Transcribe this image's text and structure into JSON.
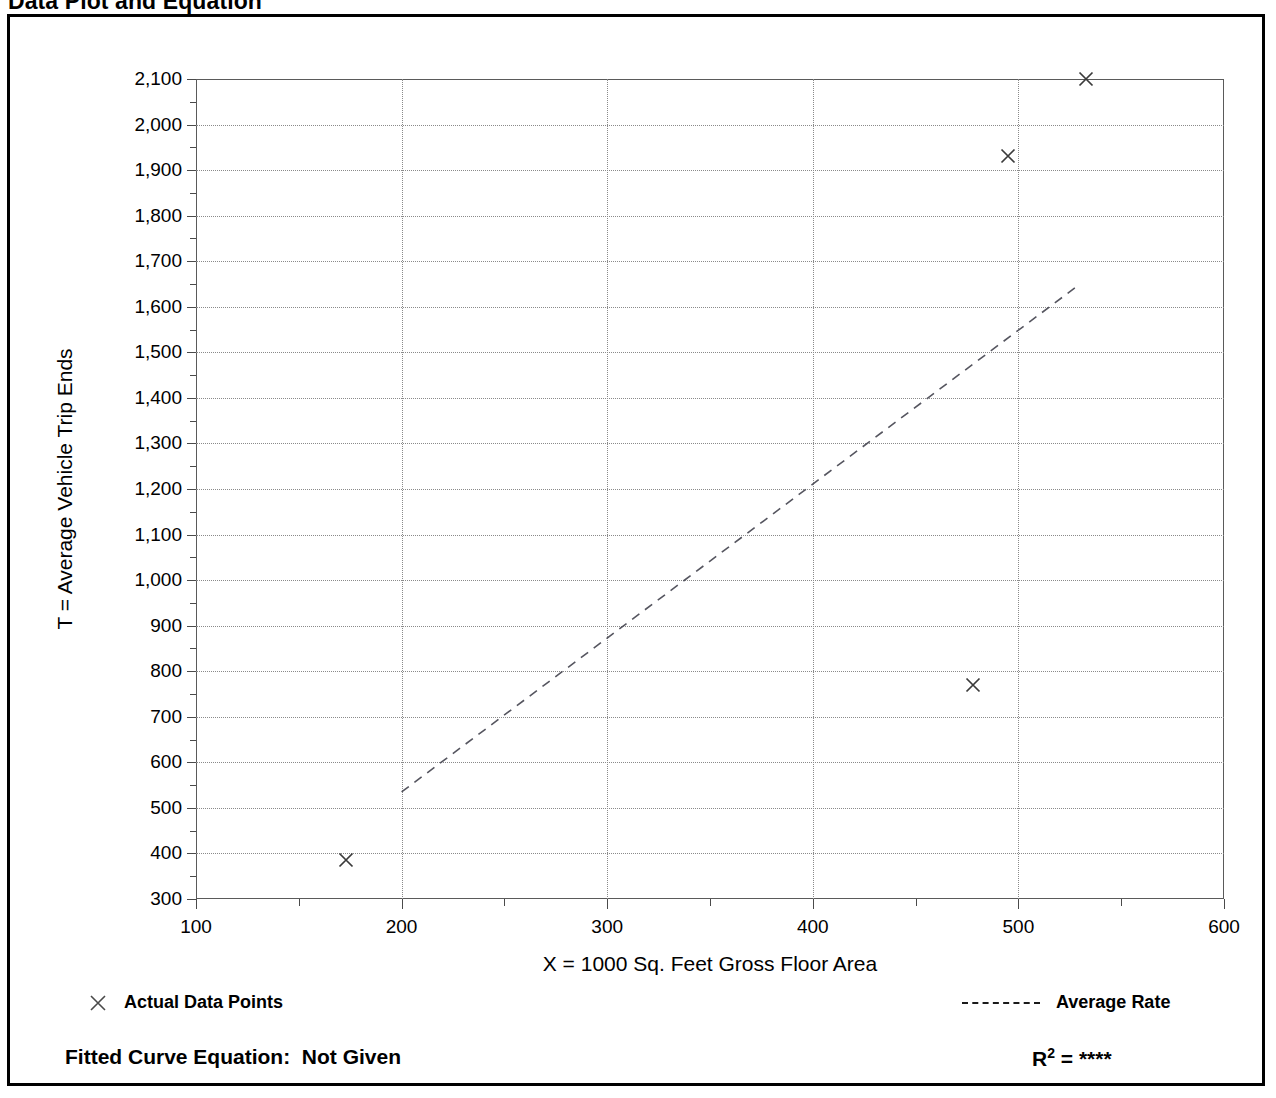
{
  "header": {
    "title": "Data Plot and Equation",
    "right_text": ""
  },
  "axis": {
    "y_title": "T = Average Vehicle Trip Ends",
    "x_title": "X = 1000 Sq. Feet Gross Floor Area"
  },
  "legend": {
    "actual_points_label": "Actual Data Points",
    "average_rate_label": "Average Rate",
    "marker_icon": "x-mark-icon",
    "line_icon": "dashed-line-icon"
  },
  "footer": {
    "equation_label": "Fitted Curve Equation:",
    "equation_value": "Not Given",
    "r2_label": "R",
    "r2_exponent": "2",
    "r2_equals": " = ",
    "r2_value": "****"
  },
  "chart_data": {
    "type": "scatter",
    "title": "Data Plot and Equation",
    "xlabel": "X = 1000 Sq. Feet Gross Floor Area",
    "ylabel": "T = Average Vehicle Trip Ends",
    "xlim": [
      100,
      600
    ],
    "ylim": [
      300,
      2100
    ],
    "xticks": [
      100,
      200,
      300,
      400,
      500,
      600
    ],
    "yticks": [
      300,
      400,
      500,
      600,
      700,
      800,
      900,
      1000,
      1100,
      1200,
      1300,
      1400,
      1500,
      1600,
      1700,
      1800,
      1900,
      2000,
      2100
    ],
    "ytick_labels": [
      "300",
      "400",
      "500",
      "600",
      "700",
      "800",
      "900",
      "1,000",
      "1,100",
      "1,200",
      "1,300",
      "1,400",
      "1,500",
      "1,600",
      "1,700",
      "1,800",
      "1,900",
      "2,000",
      "2,100"
    ],
    "xtick_labels": [
      "100",
      "200",
      "300",
      "400",
      "500",
      "600"
    ],
    "x_minor_step": 50,
    "y_minor_step": 50,
    "grid": true,
    "legend_position": "below-plot",
    "series": [
      {
        "name": "Actual Data Points",
        "type": "scatter",
        "marker": "x",
        "points": [
          {
            "x": 173,
            "y": 385
          },
          {
            "x": 478,
            "y": 770
          },
          {
            "x": 495,
            "y": 1930
          },
          {
            "x": 533,
            "y": 2100
          }
        ]
      },
      {
        "name": "Average Rate",
        "type": "line",
        "style": "dashed",
        "points": [
          {
            "x": 200,
            "y": 535
          },
          {
            "x": 530,
            "y": 1650
          }
        ]
      }
    ]
  }
}
